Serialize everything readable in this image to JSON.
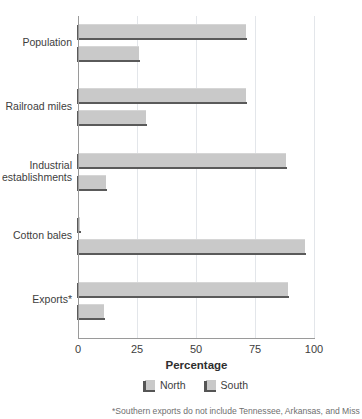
{
  "chart_data": {
    "type": "bar",
    "orientation": "horizontal",
    "title": "",
    "xlabel": "Percentage",
    "ylabel": "",
    "xlim": [
      0,
      100
    ],
    "xticks": [
      0,
      25,
      50,
      75,
      100
    ],
    "xtick_labels": [
      "0",
      "25",
      "50",
      "75",
      "100"
    ],
    "grid": true,
    "grid_axis": "x",
    "legend_position": "bottom",
    "categories": [
      "Population",
      "Railroad miles",
      "Industrial establishments",
      "Cotton bales",
      "Exports*"
    ],
    "series": [
      {
        "name": "North",
        "color": "#c9c9c9",
        "values": [
          71,
          71,
          88,
          1,
          89
        ]
      },
      {
        "name": "South",
        "color": "#c9c9c9",
        "values": [
          26,
          29,
          12,
          96,
          11
        ]
      }
    ],
    "footnote": "*Southern exports do not include Tennessee, Arkansas, and Miss"
  },
  "labels": {
    "categories": [
      {
        "line1": "Population",
        "line2": ""
      },
      {
        "line1": "Railroad miles",
        "line2": ""
      },
      {
        "line1": "Industrial",
        "line2": "establishments"
      },
      {
        "line1": "Cotton bales",
        "line2": ""
      },
      {
        "line1": "Exports*",
        "line2": ""
      }
    ],
    "ticks": [
      "0",
      "25",
      "50",
      "75",
      "100"
    ],
    "x_axis_title": "Percentage",
    "legend": [
      "North",
      "South"
    ],
    "footnote": "*Southern exports do not include Tennessee, Arkansas, and Miss"
  }
}
